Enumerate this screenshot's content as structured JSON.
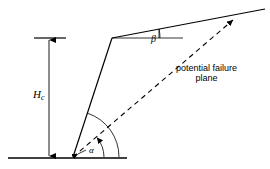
{
  "figure": {
    "background_color": "#ffffff",
    "line_color": "#000000"
  },
  "labels": {
    "height_symbol": "H",
    "height_subscript": "c",
    "slope_angle": "α",
    "surface_angle": "β",
    "failure_plane_line1": "potential failure",
    "failure_plane_line2": "plane"
  },
  "geometry": {
    "ground_line": {
      "x1": 8,
      "y1": 158,
      "x2": 127,
      "y2": 158
    },
    "toe_point": {
      "x": 73,
      "y": 157
    },
    "crest_point": {
      "x": 112,
      "y": 38
    },
    "upper_surface_end": {
      "x": 265,
      "y": 9
    },
    "failure_plane_end": {
      "x": 233,
      "y": 20
    },
    "horizontal_reference": {
      "x1": 112,
      "y1": 38,
      "x2": 183,
      "y2": 38
    },
    "dimension_line_x": 49,
    "dimension_top_y": 38,
    "dimension_bottom_y": 158,
    "tick_top": {
      "x1": 34,
      "y1": 38,
      "x2": 66,
      "y2": 38
    },
    "slope_arc_radius": 46,
    "failure_arc_radius": 31
  }
}
